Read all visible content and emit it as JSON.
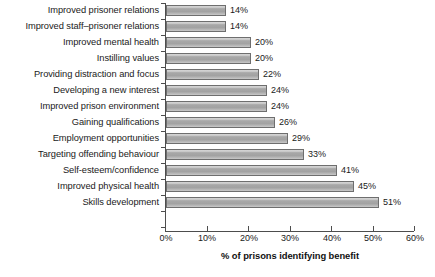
{
  "chart_data": {
    "type": "bar",
    "orientation": "horizontal",
    "title": "",
    "xlabel": "% of prisons identifying benefit",
    "ylabel": "",
    "xlim": [
      0,
      60
    ],
    "xticks": [
      "0%",
      "10%",
      "20%",
      "30%",
      "40%",
      "50%",
      "60%"
    ],
    "xtick_values": [
      0,
      10,
      20,
      30,
      40,
      50,
      60
    ],
    "grid": false,
    "legend": null,
    "value_label_suffix": "%",
    "categories": [
      "Improved prisoner relations",
      "Improved staff–prisoner relations",
      "Improved mental health",
      "Instilling values",
      "Providing distraction and focus",
      "Developing a new interest",
      "Improved prison environment",
      "Gaining qualifications",
      "Employment opportunities",
      "Targeting offending behaviour",
      "Self-esteem/confidence",
      "Improved physical health",
      "Skills development"
    ],
    "values": [
      14,
      14,
      20,
      20,
      22,
      24,
      24,
      26,
      29,
      33,
      41,
      45,
      51
    ],
    "value_labels": [
      "14%",
      "14%",
      "20%",
      "20%",
      "22%",
      "24%",
      "24%",
      "26%",
      "29%",
      "33%",
      "41%",
      "45%",
      "51%"
    ],
    "bar_fill_color": "#a8a8a8",
    "bar_edge_color": "#6e6e6e",
    "axis_color": "#4d4d4d",
    "background_color": "#ffffff"
  }
}
